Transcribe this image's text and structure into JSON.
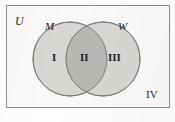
{
  "diagram": {
    "type": "venn-two-set",
    "universe_label": "U",
    "set_labels": {
      "left": "M",
      "right": "W"
    },
    "region_labels": {
      "left_only": "I",
      "intersection": "II",
      "right_only": "III",
      "outside": "IV"
    },
    "colors": {
      "circle_fill": "#d8d6d3",
      "intersection_fill": "#b9b7b4",
      "circle_stroke": "#7e7c79",
      "rect_stroke": "#8d8d8d",
      "rect_fill": "#faf9f7",
      "page_background": "#fdfdfc",
      "text": "#1c1c1c"
    },
    "geometry": {
      "rect": {
        "x": 6,
        "y": 5,
        "width": 164,
        "height": 103
      },
      "left_circle": {
        "cx": 70,
        "cy": 59,
        "r": 37
      },
      "right_circle": {
        "cx": 103,
        "cy": 59,
        "r": 37
      }
    }
  }
}
